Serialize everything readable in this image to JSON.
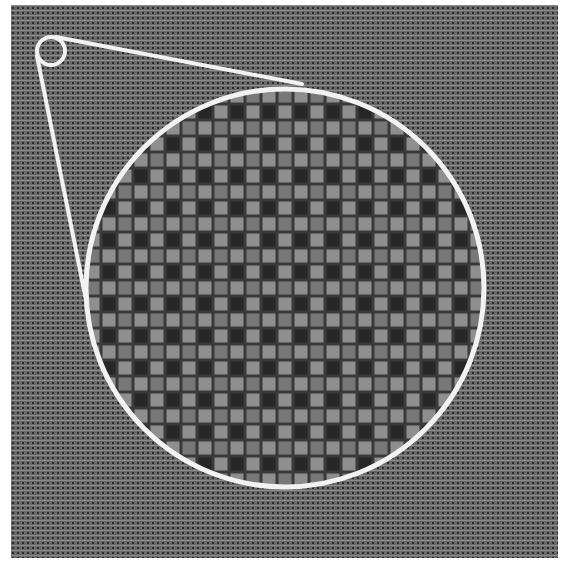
{
  "figure": {
    "canvas": {
      "width": 564,
      "height": 561
    },
    "colors": {
      "page_background": "#ffffff",
      "texture_base": "#6a6a6a",
      "texture_dot": "#2c2c2c",
      "texture_highlight": "#8a8a8a",
      "grid_line": "#3a3a3a",
      "cell_dark": "#262626",
      "cell_light": "#8e8e8e",
      "cell_mid": "#787878",
      "outline": "#f2f2f2"
    },
    "background_panel": {
      "x": 11,
      "y": 5,
      "width": 547,
      "height": 553,
      "texture_period_px": 5
    },
    "source_marker": {
      "cx": 51,
      "cy": 51,
      "r": 14,
      "stroke_width": 4
    },
    "magnified_view": {
      "cx": 285,
      "cy": 288,
      "r": 199,
      "stroke_width": 5,
      "cell_period_px": 16,
      "grid_line_px": 3
    },
    "connector_lines": [
      {
        "x1": 56,
        "y1": 37,
        "x2": 302,
        "y2": 84
      },
      {
        "x1": 37,
        "y1": 56,
        "x2": 86,
        "y2": 300
      }
    ]
  }
}
